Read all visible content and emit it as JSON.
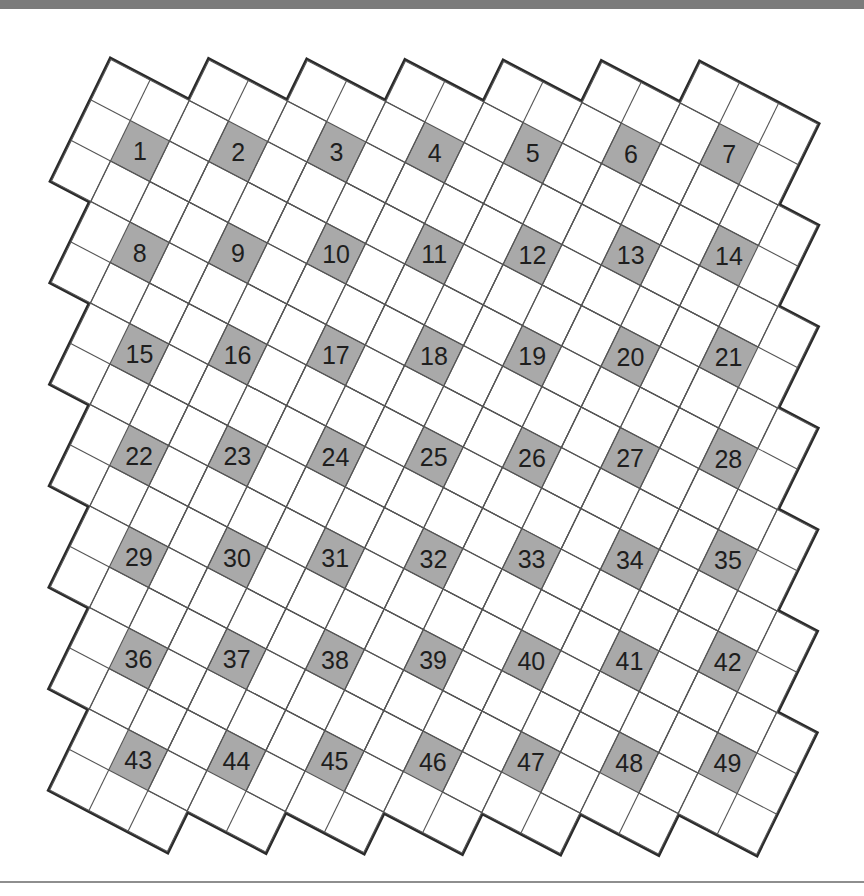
{
  "puzzle": {
    "rows": 7,
    "cols": 7,
    "block_size": 3,
    "numbers": [
      "1",
      "2",
      "3",
      "4",
      "5",
      "6",
      "7",
      "8",
      "9",
      "10",
      "11",
      "12",
      "13",
      "14",
      "15",
      "16",
      "17",
      "18",
      "19",
      "20",
      "21",
      "22",
      "23",
      "24",
      "25",
      "26",
      "27",
      "28",
      "29",
      "30",
      "31",
      "32",
      "33",
      "34",
      "35",
      "36",
      "37",
      "38",
      "39",
      "40",
      "41",
      "42",
      "43",
      "44",
      "45",
      "46",
      "47",
      "48",
      "49"
    ],
    "colors": {
      "shaded_cell": "#a9a9a9",
      "cell_fill": "#ffffff",
      "grid_line": "#555555",
      "outline": "#2a2a2a",
      "number": "#1e1e1e",
      "top_bar": "#7b7b7b",
      "bottom_rule": "#8e8e8e"
    }
  }
}
